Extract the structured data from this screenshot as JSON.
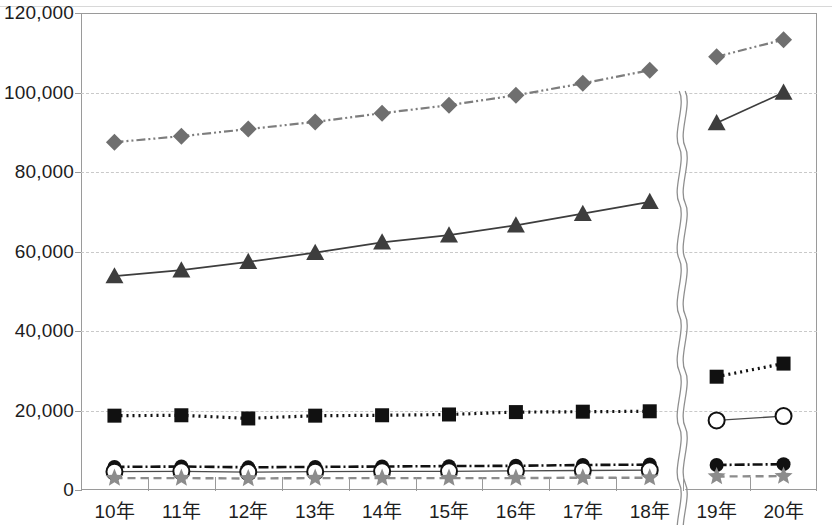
{
  "chart_data": {
    "type": "line",
    "title": "",
    "subtitle": "",
    "xlabel": "",
    "ylabel": "",
    "categories": [
      "10年",
      "11年",
      "12年",
      "13年",
      "14年",
      "15年",
      "16年",
      "17年",
      "18年",
      "19年",
      "20年"
    ],
    "ylim": [
      0,
      120000
    ],
    "ytick_labels": [
      "0",
      "20,000",
      "40,000",
      "60,000",
      "80,000",
      "100,000",
      "120,000"
    ],
    "ytick_values": [
      0,
      20000,
      40000,
      60000,
      80000,
      100000,
      120000
    ],
    "grid": "horizontal-dashed",
    "legend": "none",
    "axis_break": {
      "between": [
        "18年",
        "19年"
      ],
      "style": "double-wavy-vertical",
      "note": "series discontinue across the break"
    },
    "series": [
      {
        "name": "diamond-series",
        "marker": "diamond",
        "marker_color": "#6f6f6f",
        "line_style": "dash-dot-dot",
        "line_color": "#7d7d7d",
        "values": [
          87500,
          89000,
          90800,
          92600,
          94800,
          96800,
          99300,
          102300,
          105600,
          109000,
          113300
        ]
      },
      {
        "name": "triangle-series",
        "marker": "triangle",
        "marker_color": "#3d3d3d",
        "line_style": "solid",
        "line_color": "#3d3d3d",
        "values": [
          53800,
          55300,
          57400,
          59700,
          62300,
          64100,
          66600,
          69500,
          72500,
          92300,
          100000
        ]
      },
      {
        "name": "square-series",
        "marker": "square",
        "marker_color": "#111111",
        "line_style": "dotted",
        "line_color": "#111111",
        "values": [
          18700,
          18800,
          18000,
          18700,
          18800,
          19000,
          19600,
          19700,
          19800,
          28500,
          31800
        ]
      },
      {
        "name": "filled-circle-series",
        "marker": "circle-filled",
        "marker_color": "#111111",
        "line_style": "dash-dot",
        "line_color": "#111111",
        "values": [
          5800,
          5900,
          5700,
          5800,
          5900,
          6000,
          6100,
          6300,
          6400,
          6300,
          6500
        ]
      },
      {
        "name": "open-circle-series",
        "marker": "circle-open",
        "marker_color": "#111111",
        "line_style": "solid-thin",
        "line_color": "#4a4a4a",
        "values": [
          4600,
          4700,
          4500,
          4600,
          4700,
          4700,
          4800,
          4900,
          5000,
          17500,
          18600
        ]
      },
      {
        "name": "star-series",
        "marker": "star",
        "marker_color": "#8c8c8c",
        "line_style": "dashed",
        "line_color": "#8c8c8c",
        "values": [
          3000,
          3000,
          2900,
          3000,
          3000,
          3000,
          3000,
          3100,
          3100,
          3400,
          3500
        ]
      }
    ]
  }
}
